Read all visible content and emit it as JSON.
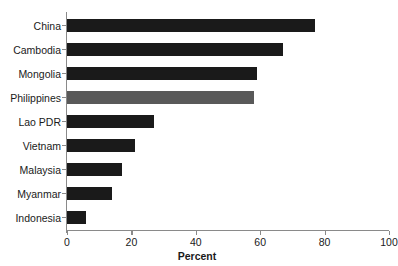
{
  "chart_data": {
    "type": "bar",
    "orientation": "horizontal",
    "title": "",
    "xlabel": "Percent",
    "ylabel": "",
    "xlim": [
      0,
      100
    ],
    "xticks": [
      0,
      20,
      40,
      60,
      80,
      100
    ],
    "grid": false,
    "legend": null,
    "categories": [
      "China",
      "Cambodia",
      "Mongolia",
      "Philippines",
      "Lao PDR",
      "Vietnam",
      "Malaysia",
      "Myanmar",
      "Indonesia"
    ],
    "values": [
      77,
      67,
      59,
      58,
      27,
      21,
      17,
      14,
      6
    ],
    "bar_colors": [
      "#1a1a1a",
      "#1a1a1a",
      "#1a1a1a",
      "#595959",
      "#1a1a1a",
      "#1a1a1a",
      "#1a1a1a",
      "#1a1a1a",
      "#1a1a1a"
    ],
    "highlighted_category": "Philippines"
  },
  "colors": {
    "bar_default": "#1a1a1a",
    "bar_highlight": "#595959",
    "axis": "#8a8a8a",
    "text": "#1a1a1a",
    "background": "#ffffff"
  }
}
